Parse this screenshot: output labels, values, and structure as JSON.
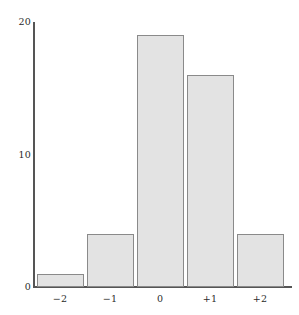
{
  "chart_data": {
    "type": "bar",
    "title": "",
    "subtitle": "",
    "xlabel": "",
    "ylabel": "",
    "categories": [
      "−2",
      "−1",
      "0",
      "+1",
      "+2"
    ],
    "values": [
      1,
      4,
      19,
      16,
      4
    ],
    "series": [
      {
        "name": "frequency",
        "values": [
          1,
          4,
          19,
          16,
          4
        ]
      }
    ],
    "ylim": [
      0,
      20
    ],
    "xlim": [
      -2.5,
      2.5
    ],
    "yticks": [
      0,
      10,
      20
    ],
    "ytick_labels": [
      "0",
      "10",
      "20"
    ],
    "xtick_labels": [
      "−2",
      "−1",
      "0",
      "+1",
      "+2"
    ],
    "grid": false,
    "legend": false,
    "legend_position": "none",
    "annotations": [],
    "colors": {
      "bar_fill": "#e3e3e3",
      "bar_border": "#8a8a8a",
      "axis": "#555555",
      "text": "#2b2b2b",
      "background": "#ffffff"
    }
  },
  "axes": {
    "y_ticks": [
      {
        "label": "20",
        "value": 20
      },
      {
        "label": "10",
        "value": 10
      },
      {
        "label": "0",
        "value": 0
      }
    ],
    "x_ticks": [
      {
        "label": "−2",
        "value": -2
      },
      {
        "label": "−1",
        "value": -1
      },
      {
        "label": "0",
        "value": 0
      },
      {
        "label": "+1",
        "value": 1
      },
      {
        "label": "+2",
        "value": 2
      }
    ]
  }
}
